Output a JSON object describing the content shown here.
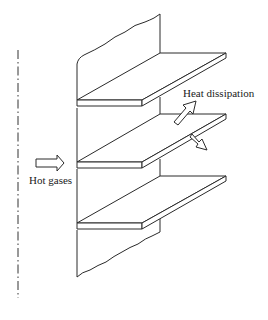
{
  "diagram": {
    "type": "fin-heat-exchanger-sketch",
    "labels": {
      "heat_dissipation": "Heat dissipation",
      "hot_gases": "Hot gases"
    },
    "elements": {
      "centerline": "dash-dot vertical axis line",
      "wall": "vertical plate with broken top and bottom edges",
      "fins": 3,
      "arrows": [
        "hot-gases-inflow",
        "heat-dissipation-up",
        "heat-dissipation-down"
      ]
    },
    "colors": {
      "line": "#2a2a2a",
      "background": "#ffffff",
      "text": "#1a1a1a"
    }
  }
}
